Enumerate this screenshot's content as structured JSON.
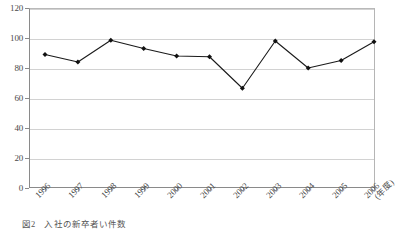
{
  "chart_data": {
    "type": "line",
    "title": "",
    "xlabel": "",
    "ylabel": "",
    "x_unit_label": "(年度)",
    "categories": [
      "1996",
      "1997",
      "1998",
      "1999",
      "2000",
      "2001",
      "2002",
      "2003",
      "2004",
      "2005",
      "2006"
    ],
    "values": [
      89,
      84,
      98.5,
      93,
      88,
      87.5,
      66.5,
      98,
      80,
      85,
      97.5
    ],
    "series": [
      {
        "name": "件数",
        "values": [
          89,
          84,
          98.5,
          93,
          88,
          87.5,
          66.5,
          98,
          80,
          85,
          97.5
        ]
      }
    ],
    "ylim": [
      0,
      120
    ],
    "y_ticks": [
      0,
      20,
      40,
      60,
      80,
      100,
      120
    ],
    "y_tick_labels": [
      "0",
      "20",
      "40",
      "60",
      "80",
      "100",
      "120"
    ],
    "grid": "horizontal",
    "legend": "none",
    "marker": "diamond",
    "line_color": "#1a1a1a",
    "marker_color": "#111111",
    "grid_color": "#d2d2d2",
    "axis_color": "#8a8a8a"
  },
  "caption": {
    "number": "図2",
    "text": "入社の新卒者い件数"
  }
}
